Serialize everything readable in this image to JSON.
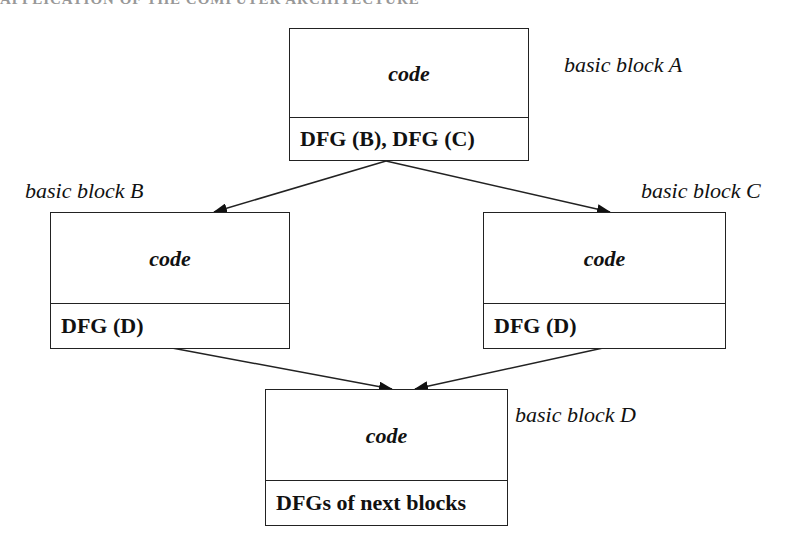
{
  "header": {
    "text": "APPLICATION OF THE COMPUTER ARCHITECTURE"
  },
  "blocks": {
    "a": {
      "label": "basic block A",
      "code": "code",
      "dfg": "DFG (B), DFG (C)"
    },
    "b": {
      "label": "basic block B",
      "code": "code",
      "dfg": "DFG (D)"
    },
    "c": {
      "label": "basic block C",
      "code": "code",
      "dfg": "DFG (D)"
    },
    "d": {
      "label": "basic block D",
      "code": "code",
      "dfg": "DFGs of next blocks"
    }
  },
  "edges": [
    {
      "from": "a",
      "to": "b"
    },
    {
      "from": "a",
      "to": "c"
    },
    {
      "from": "b",
      "to": "d"
    },
    {
      "from": "c",
      "to": "d"
    }
  ],
  "colors": {
    "stroke": "#222222",
    "background": "#ffffff"
  }
}
